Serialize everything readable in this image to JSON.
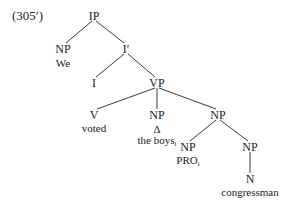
{
  "example_number": "(305′)",
  "tree": {
    "nodes": {
      "ip": {
        "label": "IP",
        "x": 94,
        "y": 16
      },
      "np_subj": {
        "label": "NP",
        "x": 63,
        "y": 49
      },
      "we": {
        "label": "We",
        "x": 63,
        "y": 63
      },
      "i_bar": {
        "label": "I′",
        "x": 126,
        "y": 49
      },
      "i": {
        "label": "I",
        "x": 94,
        "y": 83
      },
      "vp": {
        "label": "VP",
        "x": 157,
        "y": 83
      },
      "v": {
        "label": "V",
        "x": 94,
        "y": 115
      },
      "voted": {
        "label": "voted",
        "x": 94,
        "y": 128
      },
      "np_obj": {
        "label": "NP",
        "x": 157,
        "y": 115
      },
      "delta": {
        "label": "Δ",
        "x": 157,
        "y": 129
      },
      "the_boys": {
        "label": "the boys",
        "sub": "i",
        "x": 157,
        "y": 141
      },
      "np_compl": {
        "label": "NP",
        "x": 218,
        "y": 115
      },
      "np_pro": {
        "label": "NP",
        "x": 188,
        "y": 147
      },
      "pro": {
        "label": "PRO",
        "sub": "i",
        "x": 188,
        "y": 161
      },
      "np_noun": {
        "label": "NP",
        "x": 250,
        "y": 147
      },
      "n": {
        "label": "N",
        "x": 250,
        "y": 179
      },
      "congressman": {
        "label": "congressman",
        "x": 250,
        "y": 192
      }
    },
    "edges": [
      [
        "ip",
        "np_subj"
      ],
      [
        "ip",
        "i_bar"
      ],
      [
        "i_bar",
        "i"
      ],
      [
        "i_bar",
        "vp"
      ],
      [
        "vp",
        "v"
      ],
      [
        "vp",
        "np_obj"
      ],
      [
        "vp",
        "np_compl"
      ],
      [
        "np_compl",
        "np_pro"
      ],
      [
        "np_compl",
        "np_noun"
      ],
      [
        "np_noun",
        "n"
      ]
    ]
  }
}
